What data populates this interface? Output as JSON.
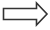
{
  "icon": {
    "name": "right-arrow-outline-icon",
    "stroke_color": "#333333",
    "fill_color": "#ffffff",
    "direction": "right"
  }
}
